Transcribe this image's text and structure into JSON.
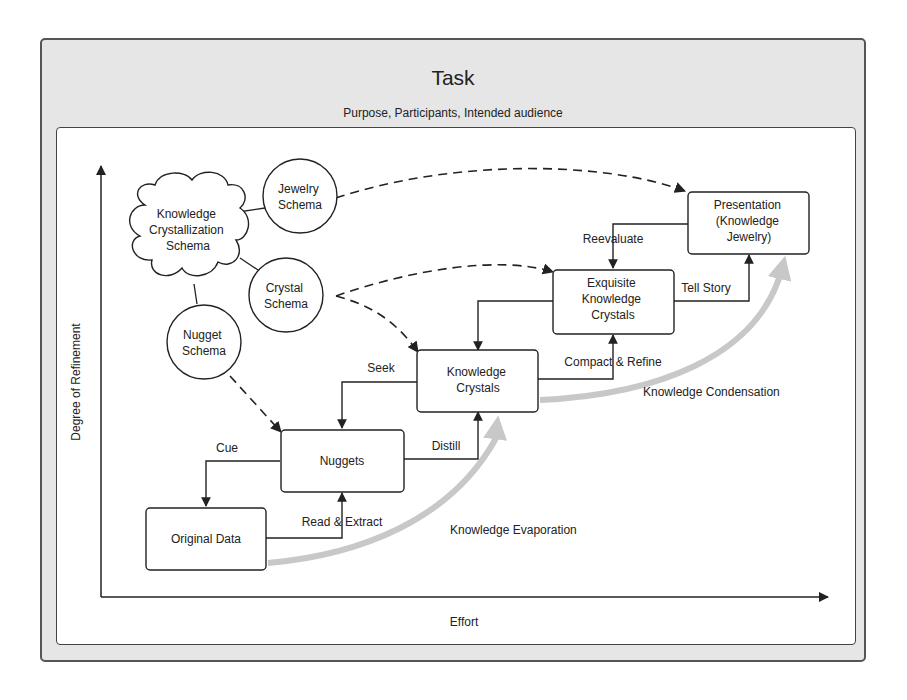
{
  "header": {
    "title": "Task",
    "subtitle": "Purpose, Participants, Intended audience"
  },
  "axes": {
    "x_label": "Effort",
    "y_label": "Degree of Refinement"
  },
  "schemas": {
    "cloud": [
      "Knowledge",
      "Crystallization",
      "Schema"
    ],
    "jewelry": [
      "Jewelry",
      "Schema"
    ],
    "crystal": [
      "Crystal",
      "Schema"
    ],
    "nugget": [
      "Nugget",
      "Schema"
    ]
  },
  "nodes": {
    "original_data": [
      "Original Data"
    ],
    "nuggets": [
      "Nuggets"
    ],
    "knowledge_crystals": [
      "Knowledge",
      "Crystals"
    ],
    "exquisite_crystals": [
      "Exquisite",
      "Knowledge",
      "Crystals"
    ],
    "presentation": [
      "Presentation",
      "(Knowledge",
      "Jewelry)"
    ]
  },
  "edges": {
    "cue": "Cue",
    "read_extract": "Read & Extract",
    "distill": "Distill",
    "seek": "Seek",
    "compact_refine": "Compact & Refine",
    "reevaluate": "Reevaluate",
    "tell_story": "Tell Story"
  },
  "flows": {
    "evaporation": "Knowledge Evaporation",
    "condensation": "Knowledge Condensation"
  },
  "colors": {
    "frame_bg": "#e6e6e6",
    "line": "#222222",
    "flow_arrow": "#c8c8c8"
  }
}
